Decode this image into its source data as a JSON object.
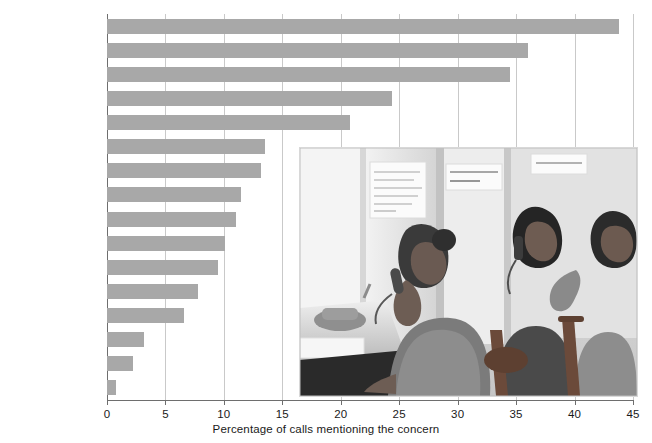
{
  "chart_data": {
    "type": "bar",
    "orientation": "horizontal",
    "title": "",
    "subtitle": "",
    "xlabel": "Percentage of calls mentioning the concern",
    "ylabel": "",
    "xlim": [
      0,
      45
    ],
    "xticks": [
      0,
      5,
      10,
      15,
      20,
      25,
      30,
      35,
      40,
      45
    ],
    "xtick_labels": [
      "0",
      "5",
      "10",
      "15",
      "20",
      "25",
      "30",
      "35",
      "40",
      "45"
    ],
    "grid": "vertical",
    "legend": "none",
    "bar_color": "#a8a8a8",
    "axis_color": "#6e6e6e",
    "gridline_color": "#c9c9c9",
    "categories": [
      "Family problems",
      "Peer relationships",
      "Self-esteem",
      "Just to talk",
      "Drugs and alcohol",
      "Abuse",
      "Sexuality",
      "School problems",
      "Death",
      "Mental illness",
      "Spirituality",
      "Pregnancy",
      "Other",
      "Legal issue",
      "Eating disorder",
      "AIDS"
    ],
    "values": [
      43.8,
      36.0,
      34.5,
      24.4,
      20.8,
      13.5,
      13.2,
      11.5,
      11.0,
      10.1,
      9.5,
      7.8,
      6.6,
      3.2,
      2.2,
      0.8
    ]
  },
  "photo": {
    "name": "crisis-hotline-call-center-photo",
    "description": "Black and white photograph of three young volunteers seated at phone desks in a crisis hotline call center",
    "wall_notes": [
      "LISTEN WITH LOVE SAVE A LIFE!",
      "SUICIDE HOT LINE"
    ]
  }
}
